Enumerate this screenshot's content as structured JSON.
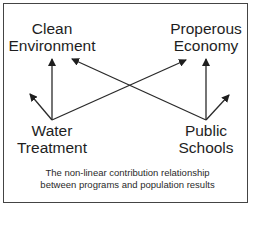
{
  "diagram": {
    "nodes": {
      "clean_environment": {
        "line1": "Clean",
        "line2": "Environment"
      },
      "prosperous_economy": {
        "line1": "Properous",
        "line2": "Economy"
      },
      "water_treatment": {
        "line1": "Water",
        "line2": "Treatment"
      },
      "public_schools": {
        "line1": "Public",
        "line2": "Schools"
      }
    },
    "edges": [
      {
        "from": "Water Treatment",
        "to": "Clean Environment"
      },
      {
        "from": "Water Treatment",
        "to": "Properous Economy"
      },
      {
        "from": "Water Treatment",
        "to": "(unlabeled, up-left)"
      },
      {
        "from": "Public Schools",
        "to": "Properous Economy"
      },
      {
        "from": "Public Schools",
        "to": "Clean Environment"
      },
      {
        "from": "Public Schools",
        "to": "(unlabeled, up-right)"
      }
    ],
    "caption": {
      "line1": "The non-linear contribution relationship",
      "line2": "between programs and population results"
    },
    "colors": {
      "stroke": "#2a2a2a",
      "border": "#444444",
      "background": "#ffffff"
    }
  }
}
